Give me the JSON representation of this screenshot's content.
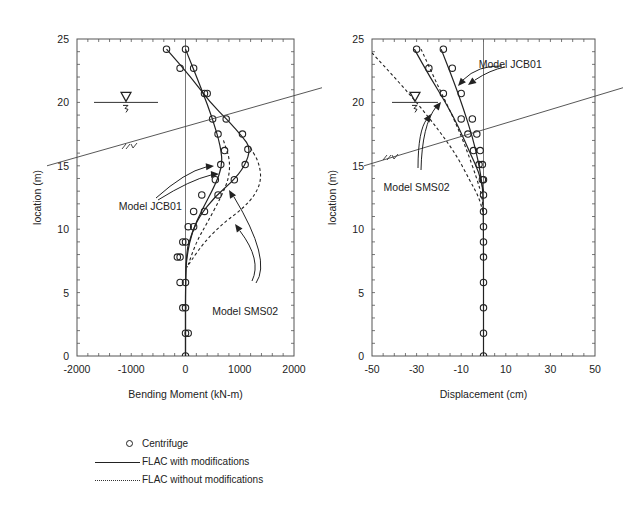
{
  "chart_data": [
    {
      "type": "line",
      "title": "",
      "xlabel": "Bending Moment (kN-m)",
      "ylabel": "location (m)",
      "xlim": [
        -2000,
        2000
      ],
      "ylim": [
        0,
        25
      ],
      "xticks": [
        -2000,
        -1000,
        0,
        1000,
        2000
      ],
      "yticks": [
        0,
        5,
        10,
        15,
        20,
        25
      ],
      "grid": false,
      "frame_px": {
        "x0": 77,
        "x1": 294,
        "y0": 39,
        "y1": 356
      },
      "series": [
        {
          "name": "Centrifuge (Model JCB01)",
          "style": "circle",
          "points": [
            [
              0,
              24.2
            ],
            [
              -100,
              22.7
            ],
            [
              350,
              20.7
            ],
            [
              500,
              18.7
            ],
            [
              600,
              17.5
            ],
            [
              720,
              16.2
            ],
            [
              650,
              15.1
            ],
            [
              550,
              13.9
            ],
            [
              300,
              12.7
            ],
            [
              150,
              11.4
            ],
            [
              50,
              10.2
            ],
            [
              -50,
              9.0
            ],
            [
              -150,
              7.8
            ],
            [
              -100,
              5.8
            ],
            [
              -50,
              3.8
            ],
            [
              0,
              1.8
            ],
            [
              0,
              0
            ]
          ]
        },
        {
          "name": "Centrifuge (Model SMS02)",
          "style": "circle",
          "points": [
            [
              -350,
              24.2
            ],
            [
              150,
              22.7
            ],
            [
              400,
              20.7
            ],
            [
              750,
              18.7
            ],
            [
              1050,
              17.5
            ],
            [
              1150,
              16.3
            ],
            [
              1100,
              15.1
            ],
            [
              900,
              13.9
            ],
            [
              600,
              12.7
            ],
            [
              350,
              11.4
            ],
            [
              150,
              10.2
            ],
            [
              0,
              9.0
            ],
            [
              -100,
              7.8
            ],
            [
              0,
              5.8
            ],
            [
              0,
              3.8
            ],
            [
              50,
              1.8
            ]
          ]
        },
        {
          "name": "FLAC with modifications (Model JCB01)",
          "style": "solid",
          "points": [
            [
              0,
              24.2
            ],
            [
              300,
              21.0
            ],
            [
              500,
              18.7
            ],
            [
              650,
              16.5
            ],
            [
              680,
              15.0
            ],
            [
              550,
              13.5
            ],
            [
              300,
              11.5
            ],
            [
              120,
              9.8
            ],
            [
              30,
              8.0
            ],
            [
              0,
              6.5
            ],
            [
              0,
              0
            ]
          ]
        },
        {
          "name": "FLAC with modifications (Model SMS02)",
          "style": "solid",
          "points": [
            [
              -350,
              24.2
            ],
            [
              100,
              22.0
            ],
            [
              450,
              20.0
            ],
            [
              800,
              18.5
            ],
            [
              1050,
              17.3
            ],
            [
              1200,
              16.4
            ],
            [
              1100,
              15.0
            ],
            [
              850,
              13.7
            ],
            [
              550,
              12.6
            ],
            [
              250,
              11.0
            ],
            [
              100,
              9.5
            ],
            [
              0,
              8.0
            ],
            [
              0,
              0
            ]
          ]
        },
        {
          "name": "FLAC without modifications (Model JCB01)",
          "style": "dashed",
          "points": [
            [
              700,
              17.0
            ],
            [
              820,
              15.5
            ],
            [
              800,
              14.0
            ],
            [
              650,
              12.5
            ],
            [
              400,
              10.5
            ],
            [
              200,
              9.0
            ],
            [
              50,
              7.2
            ]
          ]
        },
        {
          "name": "FLAC without modifications (Model SMS02)",
          "style": "dashed",
          "points": [
            [
              1200,
              16.4
            ],
            [
              1350,
              15.3
            ],
            [
              1400,
              14.0
            ],
            [
              1300,
              12.8
            ],
            [
              1050,
              11.6
            ],
            [
              700,
              10.5
            ],
            [
              350,
              9.0
            ],
            [
              100,
              7.5
            ],
            [
              30,
              7.0
            ]
          ]
        }
      ],
      "annotations": [
        {
          "text": "Model JCB01",
          "x": -650,
          "y": 11.5
        },
        {
          "text": "Model SMS02",
          "x": 1100,
          "y": 3.2
        }
      ],
      "reference_lines": {
        "vertical_zero": 0,
        "ground_slope": [
          [
            -2000,
            15.0
          ],
          [
            2000,
            21.0
          ]
        ],
        "water_table_y": 20.0
      }
    },
    {
      "type": "line",
      "title": "",
      "xlabel": "Displacement (cm)",
      "ylabel": "location (m)",
      "xlim": [
        -50,
        50
      ],
      "ylim": [
        0,
        25
      ],
      "xticks": [
        -50,
        -30,
        -10,
        10,
        30,
        50
      ],
      "yticks": [
        0,
        5,
        10,
        15,
        20,
        25
      ],
      "grid": false,
      "frame_px": {
        "x0": 372,
        "x1": 595,
        "y0": 39,
        "y1": 356
      },
      "series": [
        {
          "name": "Centrifuge (Model JCB01)",
          "style": "circle",
          "points": [
            [
              -18,
              24.2
            ],
            [
              -14,
              22.7
            ],
            [
              -10,
              20.7
            ],
            [
              -5,
              18.7
            ],
            [
              -3,
              17.5
            ],
            [
              -1.5,
              16.2
            ],
            [
              -0.5,
              15.1
            ],
            [
              0,
              13.9
            ],
            [
              0,
              12.7
            ],
            [
              0,
              11.4
            ],
            [
              0,
              10.2
            ],
            [
              0,
              9.0
            ],
            [
              0,
              7.8
            ],
            [
              0,
              5.8
            ],
            [
              0,
              3.8
            ],
            [
              0,
              1.8
            ],
            [
              0,
              0
            ]
          ]
        },
        {
          "name": "Centrifuge (Model SMS02)",
          "style": "circle",
          "points": [
            [
              -30,
              24.2
            ],
            [
              -24.5,
              22.7
            ],
            [
              -18,
              20.7
            ],
            [
              -10,
              18.7
            ],
            [
              -7,
              17.5
            ],
            [
              -4.5,
              16.2
            ],
            [
              -2,
              15.1
            ],
            [
              -0.5,
              13.9
            ]
          ]
        },
        {
          "name": "FLAC with modifications (Model JCB01)",
          "style": "solid",
          "points": [
            [
              -19,
              24.2
            ],
            [
              -13,
              21.5
            ],
            [
              -9,
              19.5
            ],
            [
              -5,
              17.3
            ],
            [
              -2.5,
              15.5
            ],
            [
              -1,
              14.0
            ],
            [
              0,
              12.5
            ],
            [
              0,
              0
            ]
          ]
        },
        {
          "name": "FLAC with modifications (Model SMS02)",
          "style": "solid",
          "points": [
            [
              -31,
              24.2
            ],
            [
              -24,
              22.0
            ],
            [
              -17,
              20.0
            ],
            [
              -11,
              18.0
            ],
            [
              -6,
              16.0
            ],
            [
              -2,
              14.5
            ],
            [
              0,
              13.0
            ]
          ]
        },
        {
          "name": "FLAC without modifications (Model JCB01)",
          "style": "dashed",
          "points": [
            [
              -28,
              24.2
            ],
            [
              -21,
              21.5
            ],
            [
              -14,
              19.0
            ],
            [
              -8,
              16.5
            ],
            [
              -3,
              14.0
            ],
            [
              -0.5,
              12.5
            ],
            [
              0,
              11.0
            ]
          ]
        },
        {
          "name": "FLAC without modifications (Model SMS02)",
          "style": "dashed",
          "points": [
            [
              -50,
              23.9
            ],
            [
              -40,
              22.0
            ],
            [
              -30,
              20.0
            ],
            [
              -20,
              17.8
            ],
            [
              -12,
              15.8
            ],
            [
              -6,
              13.8
            ],
            [
              -2,
              12.5
            ],
            [
              0,
              11.2
            ]
          ]
        }
      ],
      "annotations": [
        {
          "text": "Model JCB01",
          "x": 12,
          "y": 22.7
        },
        {
          "text": "Model SMS02",
          "x": -30,
          "y": 13.0
        }
      ],
      "reference_lines": {
        "vertical_zero": 0,
        "ground_slope": [
          [
            -50,
            15.0
          ],
          [
            50,
            21.0
          ]
        ],
        "water_table_y": 20.0
      }
    }
  ],
  "legend": {
    "items": [
      {
        "label": "Centrifuge",
        "marker": "circle"
      },
      {
        "label": "FLAC with modifications",
        "marker": "solid-line"
      },
      {
        "label": "FLAC without modifications",
        "marker": "dotted-line"
      }
    ]
  }
}
